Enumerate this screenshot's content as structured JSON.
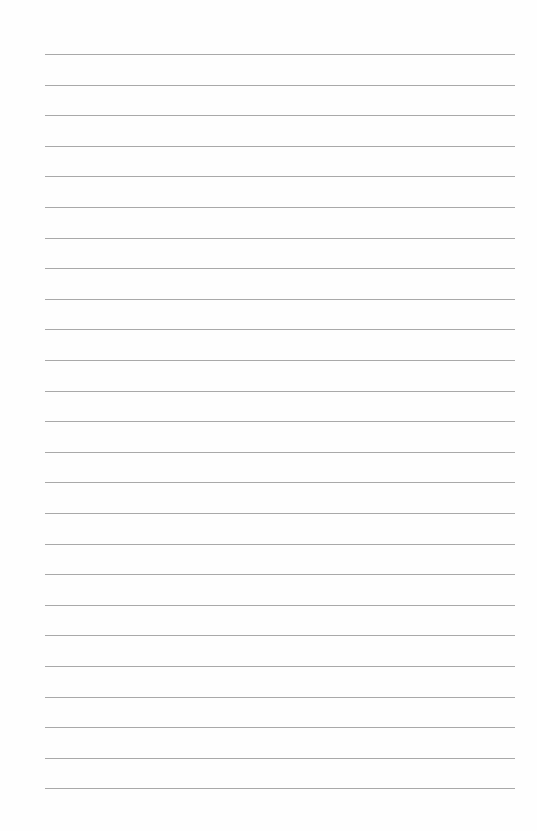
{
  "page": {
    "type": "lined-paper",
    "background_color": "#fefefe",
    "line_color": "#a9a9a9",
    "line_count": 25,
    "first_line_y": 54,
    "line_spacing": 30.6,
    "line_left": 45,
    "line_width": 470
  }
}
